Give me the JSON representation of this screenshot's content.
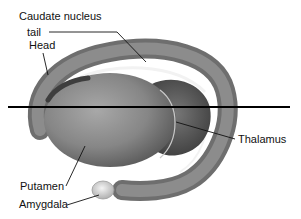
{
  "diagram": {
    "labels": {
      "caudate_nucleus": "Caudate nucleus",
      "tail": "tail",
      "head": "Head",
      "thalamus": "Thalamus",
      "putamen": "Putamen",
      "amygdala": "Amygdala"
    },
    "colors": {
      "background": "#ffffff",
      "caudate": "#7a7a7a",
      "putamen": "#8a8a8a",
      "thalamus": "#5e5e5e",
      "amygdala": "#d8d8d8",
      "leader_line": "#111111",
      "plane_line": "#000000"
    }
  }
}
